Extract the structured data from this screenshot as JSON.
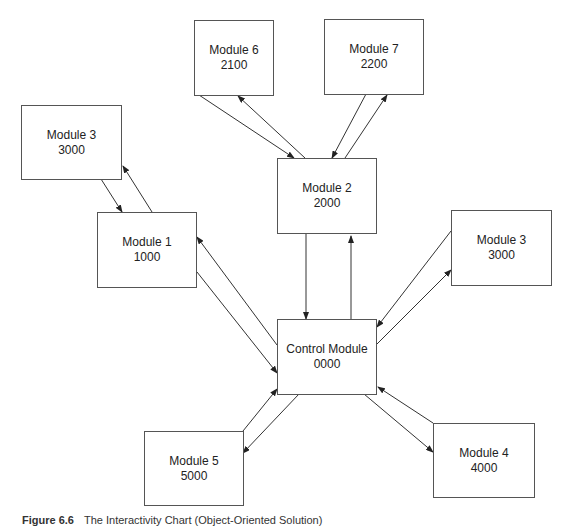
{
  "modules": {
    "m6": {
      "name": "Module 6",
      "code": "2100"
    },
    "m7": {
      "name": "Module 7",
      "code": "2200"
    },
    "m3a": {
      "name": "Module 3",
      "code": "3000"
    },
    "m2": {
      "name": "Module 2",
      "code": "2000"
    },
    "m1": {
      "name": "Module 1",
      "code": "1000"
    },
    "m3b": {
      "name": "Module 3",
      "code": "3000"
    },
    "control": {
      "name": "Control Module",
      "code": "0000"
    },
    "m5": {
      "name": "Module 5",
      "code": "5000"
    },
    "m4": {
      "name": "Module 4",
      "code": "4000"
    }
  },
  "caption": {
    "label": "Figure 6.6",
    "text": "The Interactivity Chart (Object-Oriented Solution)"
  }
}
